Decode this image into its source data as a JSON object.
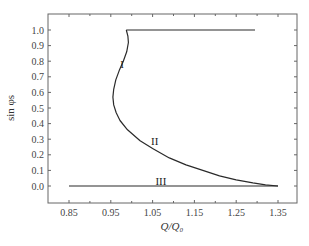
{
  "chart_data": {
    "type": "line",
    "title": "",
    "xlabel": "Q/Q₀",
    "ylabel": "sin φs",
    "xlim": [
      0.8,
      1.4
    ],
    "ylim": [
      -0.1,
      1.1
    ],
    "xticks": [
      0.85,
      0.95,
      1.05,
      1.15,
      1.25,
      1.35
    ],
    "xtick_labels": [
      "0.85",
      "0.95",
      "1.05",
      "1.15",
      "1.25",
      "1.35"
    ],
    "yticks": [
      0.0,
      0.1,
      0.2,
      0.3,
      0.4,
      0.5,
      0.6,
      0.7,
      0.8,
      0.9,
      1.0
    ],
    "ytick_labels": [
      "0.0",
      "0.1",
      "0.2",
      "0.3",
      "0.4",
      "0.5",
      "0.6",
      "0.7",
      "0.8",
      "0.9",
      "1.0"
    ],
    "grid": false,
    "legend": "none",
    "annotations": [
      {
        "text": "I",
        "x": 0.977,
        "y": 0.78
      },
      {
        "text": "II",
        "x": 1.055,
        "y": 0.29
      },
      {
        "text": "III",
        "x": 1.07,
        "y": 0.03
      }
    ],
    "series": [
      {
        "name": "upper-branch",
        "x": [
          0.987,
          1.295
        ],
        "y": [
          1.0,
          1.0
        ]
      },
      {
        "name": "I-II",
        "x": [
          0.987,
          0.991,
          0.992,
          0.988,
          0.98,
          0.97,
          0.962,
          0.957,
          0.955,
          0.957,
          0.963,
          0.972,
          0.99,
          1.02,
          1.05,
          1.09,
          1.13,
          1.17,
          1.21,
          1.25,
          1.29,
          1.32,
          1.35
        ],
        "y": [
          1.0,
          0.96,
          0.92,
          0.86,
          0.8,
          0.74,
          0.68,
          0.62,
          0.57,
          0.52,
          0.47,
          0.42,
          0.36,
          0.29,
          0.24,
          0.18,
          0.135,
          0.1,
          0.065,
          0.04,
          0.02,
          0.008,
          0.0
        ]
      },
      {
        "name": "III",
        "x": [
          0.85,
          1.35
        ],
        "y": [
          0.0,
          0.0
        ]
      }
    ]
  },
  "styles": {
    "line_color": "#2a2a2a",
    "axis_color": "#555555"
  }
}
